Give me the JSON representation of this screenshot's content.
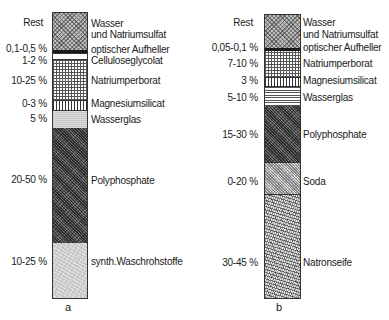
{
  "figure": {
    "columns": [
      {
        "caption": "a",
        "segments": [
          {
            "range": "Rest",
            "name_line1": "Wasser",
            "name_line2": "und Natriumsulfat",
            "pattern": "diagonal-crosshatch"
          },
          {
            "range": "0,1-0,5 %",
            "name": "optischer Aufheller",
            "pattern": "solid-black"
          },
          {
            "range": "1-2 %",
            "name": "Celluloseglycolat",
            "pattern": "white"
          },
          {
            "range": "10-25 %",
            "name": "Natriumperborat",
            "pattern": "square-grid"
          },
          {
            "range": "0-3 %",
            "name": "Magnesiumsilicat",
            "pattern": "vertical-lines"
          },
          {
            "range": "5 %",
            "name": "Wasserglas",
            "pattern": "light-gray"
          },
          {
            "range": "20-50 %",
            "name": "Polyphosphate",
            "pattern": "dark-stipple"
          },
          {
            "range": "10-25 %",
            "name": "synth.Waschrohstoffe",
            "pattern": "light-texture"
          }
        ]
      },
      {
        "caption": "b",
        "segments": [
          {
            "range": "Rest",
            "name_line1": "Wasser",
            "name_line2": "und Natriumsulfat",
            "pattern": "diagonal-crosshatch"
          },
          {
            "range": "0,05-0,1 %",
            "name": "optischer Aufheller",
            "pattern": "solid-black"
          },
          {
            "range": "7-10 %",
            "name": "Natriumperborat",
            "pattern": "square-grid"
          },
          {
            "range": "3 %",
            "name": "Magnesiumsilicat",
            "pattern": "vertical-lines"
          },
          {
            "range": "5-10 %",
            "name": "Wasserglas",
            "pattern": "horizontal-lines"
          },
          {
            "range": "15-30 %",
            "name": "Polyphosphate",
            "pattern": "dark-stipple"
          },
          {
            "range": "0-20 %",
            "name": "Soda",
            "pattern": "checker"
          },
          {
            "range": "30-45 %",
            "name": "Natronseife",
            "pattern": "coarse-speckle"
          }
        ]
      }
    ]
  }
}
